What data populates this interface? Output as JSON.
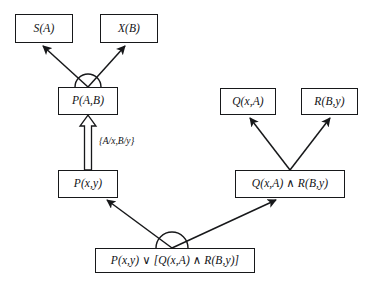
{
  "diagram": {
    "background_color": "#ffffff",
    "line_color": "#17181a",
    "text_color": "#101114",
    "nodes": [
      {
        "id": "s_a",
        "label": "S(A)",
        "x": 15,
        "y": 14,
        "w": 58,
        "h": 29
      },
      {
        "id": "x_b",
        "label": "X(B)",
        "x": 100,
        "y": 14,
        "w": 58,
        "h": 29
      },
      {
        "id": "p_ab",
        "label": "P(A,B)",
        "x": 58,
        "y": 87,
        "w": 60,
        "h": 28
      },
      {
        "id": "q_xa",
        "label": "Q(x,A)",
        "x": 220,
        "y": 88,
        "w": 56,
        "h": 27
      },
      {
        "id": "r_by",
        "label": "R(B,y)",
        "x": 301,
        "y": 88,
        "w": 57,
        "h": 27
      },
      {
        "id": "p_xy",
        "label": "P(x,y)",
        "x": 58,
        "y": 170,
        "w": 60,
        "h": 28
      },
      {
        "id": "q_and_r",
        "label": "Q(x,A) ∧ R(B,y)",
        "x": 235,
        "y": 170,
        "w": 110,
        "h": 28
      },
      {
        "id": "root",
        "label": "P(x,y) ∨ [Q(x,A) ∧ R(B,y)]",
        "x": 95,
        "y": 248,
        "w": 160,
        "h": 25
      }
    ],
    "substitution_label": "{A/x,B/y}",
    "junction_arcs": [
      {
        "id": "and-arc-upper",
        "cx": 88,
        "cy": 87,
        "r": 13
      },
      {
        "id": "and-arc-lower",
        "cx": 172,
        "cy": 248,
        "r": 16
      }
    ],
    "edges": [
      {
        "id": "edge-p_ab-to-s_a",
        "from": "p_ab",
        "to": "s_a",
        "x1": 88,
        "y1": 87,
        "x2": 42,
        "y2": 45,
        "style": "solid-arrow"
      },
      {
        "id": "edge-p_ab-to-x_b",
        "from": "p_ab",
        "to": "x_b",
        "x1": 88,
        "y1": 87,
        "x2": 126,
        "y2": 45,
        "style": "solid-arrow"
      },
      {
        "id": "edge-p_xy-to-p_ab",
        "from": "p_xy",
        "to": "p_ab",
        "x1": 88,
        "y1": 170,
        "x2": 88,
        "y2": 116,
        "style": "hollow-arrow"
      },
      {
        "id": "edge-qr-to-q_xa",
        "from": "q_and_r",
        "to": "q_xa",
        "x1": 290,
        "y1": 170,
        "x2": 249,
        "y2": 117,
        "style": "solid-arrow"
      },
      {
        "id": "edge-qr-to-r_by",
        "from": "q_and_r",
        "to": "r_by",
        "x1": 290,
        "y1": 170,
        "x2": 331,
        "y2": 117,
        "style": "solid-arrow"
      },
      {
        "id": "edge-root-to-p_xy",
        "from": "root",
        "to": "p_xy",
        "x1": 172,
        "y1": 248,
        "x2": 106,
        "y2": 200,
        "style": "solid-arrow"
      },
      {
        "id": "edge-root-to-qr",
        "from": "root",
        "to": "q_and_r",
        "x1": 172,
        "y1": 248,
        "x2": 277,
        "y2": 200,
        "style": "solid-arrow"
      }
    ]
  }
}
